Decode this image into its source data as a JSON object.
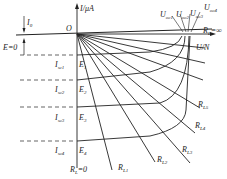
{
  "diagram": {
    "type": "solar-cell I-U characteristic curves",
    "axes": {
      "y_label": "I/μA",
      "x_label": "U/N",
      "origin_label": "O"
    },
    "labels": {
      "i0": "I",
      "i0_sub": "0",
      "e_zero": "E=0",
      "rl_inf": "R",
      "rl_inf_sub": "L",
      "rl_inf_val": "=∞",
      "rl_zero": "R",
      "rl_zero_sub": "L",
      "rl_zero_val": "=0"
    },
    "short_circuit_currents": [
      {
        "label": "I",
        "sub": "sc1",
        "e": "E",
        "e_sub": "1"
      },
      {
        "label": "I",
        "sub": "sc2",
        "e": "E",
        "e_sub": "2"
      },
      {
        "label": "I",
        "sub": "sc3",
        "e": "E",
        "e_sub": "3"
      },
      {
        "label": "I",
        "sub": "sc4",
        "e": "E",
        "e_sub": "4"
      }
    ],
    "open_circuit_voltages": [
      {
        "label": "U",
        "sub": "oc1"
      },
      {
        "label": "U",
        "sub": "oc2"
      },
      {
        "label": "U",
        "sub": "oc3"
      },
      {
        "label": "U",
        "sub": "oc4"
      }
    ],
    "load_lines": [
      {
        "label": "R",
        "sub": "L1"
      },
      {
        "label": "R",
        "sub": "L2"
      },
      {
        "label": "R",
        "sub": "L3"
      },
      {
        "label": "R",
        "sub": "L4"
      },
      {
        "label": "R",
        "sub": "L5"
      }
    ]
  }
}
